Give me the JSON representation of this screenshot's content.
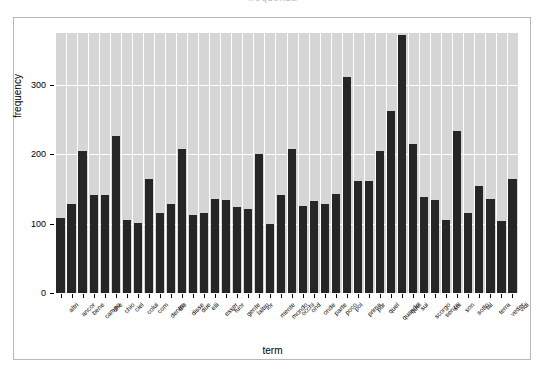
{
  "figure": {
    "title_remnant": "frequenza",
    "background": "#ffffff",
    "panel_color": "#d6d6d6",
    "bar_color": "#262626",
    "grid_color": "#ffffff",
    "frame_color": "#b9b9b9"
  },
  "chart_data": {
    "type": "bar",
    "title": "",
    "xlabel": "term",
    "ylabel": "frequency",
    "ylim": [
      0,
      375
    ],
    "yticks": [
      0,
      100,
      200,
      300
    ],
    "grid": true,
    "legend": "none",
    "categories": [
      "altri",
      "ancor",
      "bene",
      "campo",
      "che",
      "chio",
      "ciel",
      "colui",
      "com",
      "dentro",
      "dio",
      "disse",
      "due",
      "elli",
      "esser",
      "fuor",
      "gente",
      "laltro",
      "lor",
      "mente",
      "mondo",
      "occhi",
      "ond",
      "onde",
      "parte",
      "poco",
      "poi",
      "prima",
      "pur",
      "quel",
      "quando",
      "quel",
      "sui",
      "scorgo",
      "senza",
      "sol",
      "son",
      "sotto",
      "tal",
      "terra",
      "veder",
      "vidi"
    ],
    "values": [
      108,
      129,
      205,
      141,
      141,
      227,
      105,
      101,
      164,
      116,
      128,
      207,
      112,
      115,
      135,
      134,
      124,
      121,
      201,
      100,
      142,
      208,
      126,
      133,
      129,
      143,
      312,
      161,
      162,
      205,
      263,
      372,
      215,
      139,
      134,
      105,
      234,
      116,
      155,
      135,
      104,
      165
    ]
  },
  "axis": {
    "y_tick_labels": [
      "0",
      "100",
      "200",
      "300"
    ],
    "x_axis_title": "term",
    "y_axis_title": "frequency"
  }
}
